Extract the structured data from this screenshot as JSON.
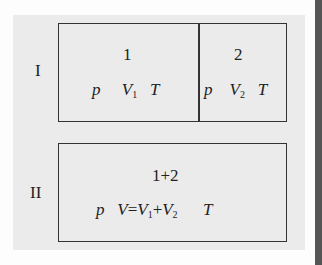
{
  "rows": [
    {
      "label": "I",
      "compartments": [
        {
          "title": "1",
          "vars": {
            "p": "p",
            "V": "V",
            "V_sub": "1",
            "T": "T"
          }
        },
        {
          "title": "2",
          "vars": {
            "p": "p",
            "V": "V",
            "V_sub": "2",
            "T": "T"
          }
        }
      ]
    },
    {
      "label": "II",
      "compartments": [
        {
          "title": "1+2",
          "vars": {
            "p": "p",
            "V": "V",
            "eq": "=",
            "V1": "V",
            "V1_sub": "1",
            "plus": "+",
            "V2": "V",
            "V2_sub": "2",
            "T": "T"
          }
        }
      ]
    }
  ],
  "colors": {
    "panel": "#ebebeb",
    "border": "#333333",
    "sidebar": "#555555"
  }
}
